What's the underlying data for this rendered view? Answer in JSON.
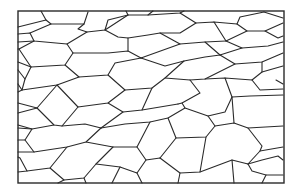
{
  "diagram": {
    "type": "cell-network",
    "colors": {
      "stroke": "#2a2a2a",
      "background": "#ffffff"
    },
    "frame": {
      "x": 18,
      "y": 11,
      "width": 266,
      "height": 172
    },
    "edges": [
      "M18,27 L46,20 L41,11",
      "M46,20 L51,24 L84,24 L88,12",
      "M84,24 L78,29 L87,32 L105,30 L108,20 L128,15 L126,11",
      "M105,30 L128,15",
      "M128,15 L148,15 L153,11",
      "M148,15 L180,13 L184,11",
      "M180,13 L196,23 L214,22 L237,24 L240,17 L264,12",
      "M237,24 L247,31 L265,31 L283,23",
      "M264,12 L283,18",
      "M18,34 L30,33 L34,41 L67,44 L73,53 L108,53 L128,51 L141,58",
      "M51,24 L30,33",
      "M87,32 L67,44",
      "M105,30 L118,37 L128,38 L128,51",
      "M128,38 L148,35 L160,33 L180,33 L196,23",
      "M160,33 L180,44 L205,42 L226,41",
      "M214,22 L226,41 L247,31",
      "M226,41 L242,48 L268,46 L283,42",
      "M265,31 L278,38 L283,36",
      "M18,42 L34,41",
      "M18,49 L19,49 L34,41",
      "M19,49 L31,67 L65,65 L73,53",
      "M65,65 L79,77 L108,75 L115,63 L141,58",
      "M141,58 L180,44",
      "M141,58 L165,66 L184,61 L205,57 L220,55",
      "M205,42 L220,55 L242,48",
      "M220,55 L235,64 L262,62 L283,53",
      "M18,62 L31,67",
      "M18,70 L25,79 L31,67",
      "M25,79 L22,90",
      "M18,84 L22,90 L57,85 L79,77",
      "M108,75 L125,90 L152,88 L165,78 L184,61",
      "M165,78 L190,80 L205,79 L235,64",
      "M205,79 L225,78 L252,80 L262,72 L283,66",
      "M262,62 L262,72",
      "M57,85 L78,107 L108,103 L125,90",
      "M18,92 L22,90",
      "M18,103 L37,108 L57,85",
      "M37,108 L54,125 L62,126 L78,107",
      "M108,103 L123,112 L142,110 L152,88",
      "M142,110 L178,104",
      "M190,80 L200,93 L182,103 L178,104",
      "M182,103 L185,108 L208,116 L225,112 L232,97 L225,78",
      "M232,97 L250,96 L283,95",
      "M252,80 L260,90 L283,89",
      "M283,84 L276,80",
      "M18,113 L37,108",
      "M18,125 L32,129 L54,125",
      "M62,126 L85,124 L101,128 L123,112",
      "M101,128 L125,124 L150,122 L168,118 L185,108",
      "M168,118 L176,138 L206,137 L215,126 L208,116",
      "M215,126 L234,123 L248,128 L283,126",
      "M232,97 L234,123",
      "M18,128 L32,129 L25,140 L18,140",
      "M25,140 L34,152 L67,147 L86,142 L101,128",
      "M86,142 L113,147 L137,147 L150,122",
      "M137,147 L146,160 L160,158",
      "M160,158 L176,138",
      "M160,158 L180,173 L200,172 L206,137",
      "M200,172 L232,160 L248,164 L260,151 L283,147",
      "M248,128 L262,146 L260,151",
      "M283,160 L278,156 L262,160 L248,164",
      "M18,152 L34,152",
      "M18,157 L20,158 L27,171 L18,172",
      "M27,171 L50,168 L67,147",
      "M50,168 L64,180 L84,178 L96,164 L113,147",
      "M96,164 L120,167 L137,173 L146,160",
      "M137,173 L142,183",
      "M120,167 L112,183",
      "M84,178 L86,183",
      "M64,180 L58,183",
      "M180,173 L178,183",
      "M232,160 L234,183",
      "M248,164 L252,171 L266,175 L283,175",
      "M266,175 L262,183"
    ]
  }
}
